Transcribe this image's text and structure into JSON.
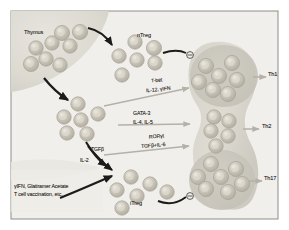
{
  "figure": {
    "background": "#f2f0ec",
    "border_color": "#8c8c8c"
  },
  "labels": {
    "thymus": "Thymus",
    "ntreg": "nTreg",
    "itreg": "iTreg",
    "th1": "Th1",
    "th2": "Th2",
    "th17": "Th17",
    "tbet": "T-bet",
    "tbet_cytokines": "IL-12, γIFN",
    "gata3": "GATA-3",
    "gata3_cytokines": "IL-4, IL-5",
    "rorgt": "RORγt",
    "rorgt_cytokines": "TGFβ+IL-6",
    "tgfb": "TGFβ",
    "il2": "IL-2",
    "therapy_line1": "γIFN, Glatiramer Acetate",
    "therapy_line2": "T cell vaccination, etc.",
    "inhibit_symbol": "⊖"
  },
  "colors": {
    "panel_bg": "#f1efeb",
    "thymus_fill": "#dedcd4",
    "blob_fill": "#dddbd4",
    "blob_dark": "#c9c6bd",
    "cell_fill": "#bbb7ab",
    "cell_highlight": "#d9d6cc",
    "cell_stroke": "#a9a498",
    "arrow_dark": "#1c1b19",
    "arrow_light": "#b9b6ae",
    "text": "#2d2a26"
  },
  "cells": {
    "thymus_cluster": [
      {
        "cx": 36,
        "cy": 48,
        "r": 7.2
      },
      {
        "cx": 52,
        "cy": 43,
        "r": 7.2
      },
      {
        "cx": 62,
        "cy": 33,
        "r": 7.6
      },
      {
        "cx": 70,
        "cy": 46,
        "r": 7.2
      },
      {
        "cx": 80,
        "cy": 32,
        "r": 7.6
      },
      {
        "cx": 46,
        "cy": 59,
        "r": 7.2
      },
      {
        "cx": 31,
        "cy": 64,
        "r": 7.6
      },
      {
        "cx": 60,
        "cy": 65,
        "r": 7.2
      }
    ],
    "ntreg_cluster": [
      {
        "cx": 119,
        "cy": 56,
        "r": 7.2
      },
      {
        "cx": 135,
        "cy": 42,
        "r": 7.2
      },
      {
        "cx": 154,
        "cy": 48,
        "r": 7.6
      },
      {
        "cx": 137,
        "cy": 60,
        "r": 7.2
      },
      {
        "cx": 155,
        "cy": 63,
        "r": 7.2
      },
      {
        "cx": 122,
        "cy": 75,
        "r": 7.2
      }
    ],
    "naive_cluster": [
      {
        "cx": 78,
        "cy": 104,
        "r": 7.2
      },
      {
        "cx": 64,
        "cy": 117,
        "r": 7.2
      },
      {
        "cx": 81,
        "cy": 120,
        "r": 7.2
      },
      {
        "cx": 98,
        "cy": 114,
        "r": 7.2
      },
      {
        "cx": 67,
        "cy": 133,
        "r": 7.2
      },
      {
        "cx": 87,
        "cy": 134,
        "r": 7.2
      }
    ],
    "itreg_cluster": [
      {
        "cx": 131,
        "cy": 177,
        "r": 7.2
      },
      {
        "cx": 117,
        "cy": 190,
        "r": 7.2
      },
      {
        "cx": 150,
        "cy": 184,
        "r": 7.2
      },
      {
        "cx": 137,
        "cy": 196,
        "r": 7.2
      },
      {
        "cx": 167,
        "cy": 192,
        "r": 7.2
      },
      {
        "cx": 122,
        "cy": 208,
        "r": 7.2
      }
    ],
    "th1_cluster": [
      {
        "cx": 206,
        "cy": 66,
        "r": 7.6
      },
      {
        "cx": 232,
        "cy": 63,
        "r": 7.6
      },
      {
        "cx": 219,
        "cy": 76,
        "r": 7.6
      },
      {
        "cx": 199,
        "cy": 82,
        "r": 7.6
      },
      {
        "cx": 237,
        "cy": 80,
        "r": 7.6
      },
      {
        "cx": 213,
        "cy": 90,
        "r": 7.6
      },
      {
        "cx": 228,
        "cy": 94,
        "r": 7.6
      }
    ],
    "th2_cluster": [
      {
        "cx": 214,
        "cy": 117,
        "r": 7.2
      },
      {
        "cx": 229,
        "cy": 121,
        "r": 7.2
      },
      {
        "cx": 211,
        "cy": 131,
        "r": 7.2
      },
      {
        "cx": 228,
        "cy": 136,
        "r": 7.2
      },
      {
        "cx": 216,
        "cy": 146,
        "r": 7.2
      }
    ],
    "th17_cluster": [
      {
        "cx": 211,
        "cy": 164,
        "r": 7.6
      },
      {
        "cx": 236,
        "cy": 169,
        "r": 7.6
      },
      {
        "cx": 198,
        "cy": 177,
        "r": 7.6
      },
      {
        "cx": 221,
        "cy": 177,
        "r": 7.6
      },
      {
        "cx": 242,
        "cy": 184,
        "r": 7.6
      },
      {
        "cx": 206,
        "cy": 189,
        "r": 7.6
      },
      {
        "cx": 228,
        "cy": 192,
        "r": 7.6
      }
    ]
  },
  "pathways": [
    {
      "name": "th1",
      "factor": "T-bet",
      "cytokines": "IL-12, γIFN"
    },
    {
      "name": "th2",
      "factor": "GATA-3",
      "cytokines": "IL-4, IL-5"
    },
    {
      "name": "th17",
      "factor": "RORγt",
      "cytokines": "TGFβ+IL-6"
    }
  ]
}
